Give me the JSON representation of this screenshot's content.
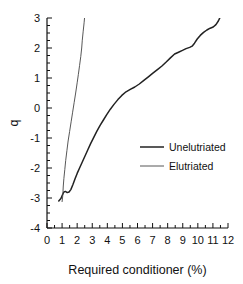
{
  "chart_data": {
    "type": "line",
    "title": "",
    "xlabel": "Required conditioner (%)",
    "ylabel": "q",
    "xlim": [
      0,
      12
    ],
    "ylim": [
      -4,
      3
    ],
    "grid": false,
    "legend_position": "center-right",
    "xticks": [
      0,
      1,
      2,
      3,
      4,
      5,
      6,
      7,
      8,
      9,
      10,
      11,
      12
    ],
    "xticklabels": [
      "0",
      "1",
      "2",
      "3",
      "4",
      "5",
      "6",
      "7",
      "8",
      "9",
      "10",
      "11",
      "12"
    ],
    "xminor_step": 0.5,
    "yticks": [
      3,
      2,
      1,
      0,
      -1,
      -2,
      -3,
      -4
    ],
    "yticklabels": [
      "3",
      "2",
      "1",
      "0",
      "-1",
      "-2",
      "-3",
      "-4"
    ],
    "yminor_step": 0.25,
    "series": [
      {
        "name": "Unelutriated",
        "color": "#222222",
        "linewidth": 1.5,
        "points": [
          [
            0.78,
            -3.1
          ],
          [
            0.92,
            -3.02
          ],
          [
            1.02,
            -2.9
          ],
          [
            1.12,
            -2.8
          ],
          [
            1.22,
            -2.78
          ],
          [
            1.34,
            -2.82
          ],
          [
            1.46,
            -2.8
          ],
          [
            1.58,
            -2.72
          ],
          [
            1.72,
            -2.55
          ],
          [
            1.86,
            -2.36
          ],
          [
            2.0,
            -2.18
          ],
          [
            2.16,
            -2.0
          ],
          [
            2.34,
            -1.8
          ],
          [
            2.52,
            -1.6
          ],
          [
            2.7,
            -1.4
          ],
          [
            2.9,
            -1.18
          ],
          [
            3.1,
            -0.98
          ],
          [
            3.3,
            -0.78
          ],
          [
            3.52,
            -0.58
          ],
          [
            3.74,
            -0.4
          ],
          [
            3.96,
            -0.22
          ],
          [
            4.2,
            -0.04
          ],
          [
            4.44,
            0.12
          ],
          [
            4.7,
            0.28
          ],
          [
            4.96,
            0.42
          ],
          [
            5.24,
            0.54
          ],
          [
            5.52,
            0.62
          ],
          [
            5.82,
            0.7
          ],
          [
            6.12,
            0.8
          ],
          [
            6.42,
            0.92
          ],
          [
            6.72,
            1.04
          ],
          [
            7.02,
            1.16
          ],
          [
            7.32,
            1.28
          ],
          [
            7.62,
            1.4
          ],
          [
            7.92,
            1.54
          ],
          [
            8.2,
            1.68
          ],
          [
            8.46,
            1.8
          ],
          [
            8.72,
            1.86
          ],
          [
            8.98,
            1.92
          ],
          [
            9.22,
            1.98
          ],
          [
            9.46,
            2.02
          ],
          [
            9.62,
            2.06
          ],
          [
            9.78,
            2.16
          ],
          [
            9.96,
            2.3
          ],
          [
            10.16,
            2.42
          ],
          [
            10.38,
            2.52
          ],
          [
            10.6,
            2.6
          ],
          [
            10.82,
            2.66
          ],
          [
            11.02,
            2.7
          ],
          [
            11.2,
            2.78
          ],
          [
            11.36,
            2.9
          ],
          [
            11.5,
            3.05
          ]
        ]
      },
      {
        "name": "Elutriated",
        "color": "#444444",
        "linewidth": 0.9,
        "points": [
          [
            1.0,
            -3.12
          ],
          [
            1.04,
            -2.95
          ],
          [
            1.06,
            -2.78
          ],
          [
            1.08,
            -2.6
          ],
          [
            1.12,
            -2.35
          ],
          [
            1.18,
            -2.05
          ],
          [
            1.24,
            -1.75
          ],
          [
            1.32,
            -1.42
          ],
          [
            1.4,
            -1.1
          ],
          [
            1.5,
            -0.78
          ],
          [
            1.6,
            -0.46
          ],
          [
            1.7,
            -0.14
          ],
          [
            1.8,
            0.18
          ],
          [
            1.9,
            0.5
          ],
          [
            2.0,
            0.84
          ],
          [
            2.08,
            1.12
          ],
          [
            2.16,
            1.42
          ],
          [
            2.24,
            1.72
          ],
          [
            2.3,
            2.0
          ],
          [
            2.34,
            2.26
          ],
          [
            2.4,
            2.56
          ],
          [
            2.46,
            2.84
          ],
          [
            2.5,
            3.06
          ]
        ]
      }
    ]
  },
  "legend": {
    "entries": [
      {
        "label": "Unelutriated"
      },
      {
        "label": "Elutriated"
      }
    ]
  }
}
